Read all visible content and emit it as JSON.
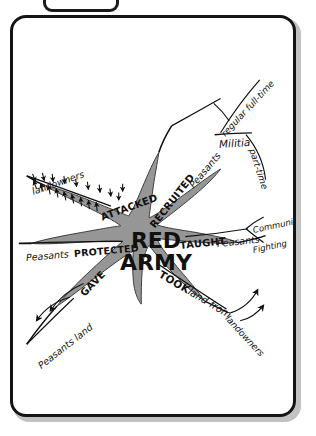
{
  "page": {
    "type": "hand-drawn-mind-map",
    "background_color": "#ffffff",
    "card_border_color": "#141414",
    "blob_fill_color": "#969696",
    "ink_color": "#111111"
  },
  "center": {
    "line1": "RED",
    "line2": "ARMY"
  },
  "branches": [
    {
      "id": "attacked",
      "direction": "upper-left",
      "label": "ATTACKED",
      "children": [
        {
          "id": "landowners",
          "label": "landowners",
          "decoration": "many-small-arrows"
        }
      ]
    },
    {
      "id": "protected",
      "direction": "left",
      "label": "PROTECTED",
      "children": [
        {
          "id": "peasants-protected",
          "label": "Peasants",
          "decoration": "none"
        }
      ]
    },
    {
      "id": "gave",
      "direction": "lower-left",
      "label": "GAVE",
      "children": [
        {
          "id": "peasants-land",
          "label": "Peasants  land",
          "decoration": "two-curved-arrows"
        }
      ]
    },
    {
      "id": "recruited",
      "direction": "upper-right",
      "label": "RECRUITED",
      "children": [
        {
          "id": "peasants-recruited",
          "label": "Peasants",
          "children": [
            {
              "id": "militia",
              "label": "Militia",
              "children": [
                {
                  "id": "regular-full-time",
                  "label": "regular full-time"
                },
                {
                  "id": "part-time",
                  "label": "part-time"
                }
              ]
            }
          ]
        }
      ]
    },
    {
      "id": "taught",
      "direction": "right",
      "label": "TAUGHT",
      "children": [
        {
          "id": "peasants-taught",
          "label": "Peasants",
          "children": [
            {
              "id": "communism",
              "label": "Communism"
            },
            {
              "id": "fighting",
              "label": "Fighting"
            }
          ]
        }
      ]
    },
    {
      "id": "took",
      "direction": "lower-right",
      "label": "TOOK",
      "children": [
        {
          "id": "land-from-landowners",
          "label": "land from",
          "target": "landowners",
          "decoration": "two-curved-arrows"
        }
      ]
    }
  ],
  "labels": {
    "attacked": "ATTACKED",
    "landowners_top": "landowners",
    "protected": "PROTECTED",
    "peasants_left": "Peasants",
    "gave": "GAVE",
    "peasants_land": "Peasants   land",
    "recruited": "RECRUITED",
    "peasants_recruit": "Peasants",
    "militia": "Militia",
    "regular_full_time": "regular full-time",
    "part_time": "part-time",
    "taught": "TAUGHT",
    "peasants_taught": "Peasants",
    "communism": "Communism",
    "fighting": "Fighting",
    "took": "TOOK",
    "land_from": "land from",
    "landowners_bottom": "landowners"
  }
}
